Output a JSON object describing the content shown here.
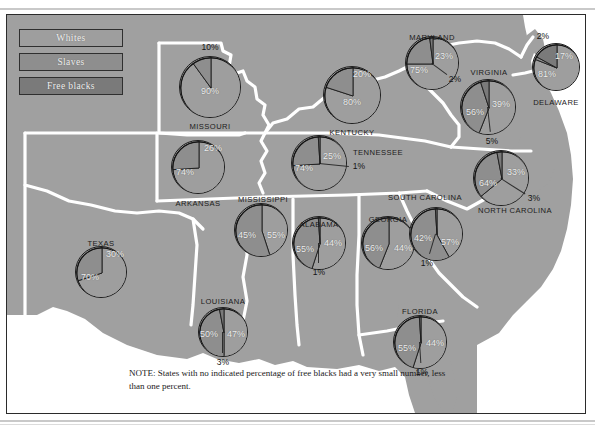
{
  "figure": {
    "title_fragment": "",
    "note": "NOTE: States with no indicated percentage of free blacks had a very small number, less than one percent."
  },
  "legend": {
    "items": [
      {
        "label": "Whites",
        "color": "#9e9e9e"
      },
      {
        "label": "Slaves",
        "color": "#8e8e8e"
      },
      {
        "label": "Free blacks",
        "color": "#7a7a7a"
      }
    ]
  },
  "chart_data": {
    "type": "pie",
    "legend": [
      "Whites",
      "Slaves",
      "Free blacks"
    ],
    "legend_position": "top-left",
    "units": "percent",
    "note": "NOTE: States with no indicated percentage of free blacks had a very small number, less than one percent.",
    "series": [
      {
        "name": "Whites",
        "color": "#9e9e9e"
      },
      {
        "name": "Slaves",
        "color": "#8e8e8e"
      },
      {
        "name": "Free blacks",
        "color": "#7a7a7a"
      }
    ],
    "states": [
      {
        "id": "missouri",
        "name": "MISSOURI",
        "whites": 90,
        "slaves": 10,
        "free_blacks": null,
        "labels": {
          "whites": "90%",
          "slaves": "10%",
          "free_blacks": ""
        }
      },
      {
        "id": "arkansas",
        "name": "ARKANSAS",
        "whites": 74,
        "slaves": 26,
        "free_blacks": null,
        "labels": {
          "whites": "74%",
          "slaves": "26%",
          "free_blacks": ""
        }
      },
      {
        "id": "texas",
        "name": "TEXAS",
        "whites": 70,
        "slaves": 30,
        "free_blacks": null,
        "labels": {
          "whites": "70%",
          "slaves": "30%",
          "free_blacks": ""
        }
      },
      {
        "id": "louisiana",
        "name": "LOUISIANA",
        "whites": 50,
        "slaves": 47,
        "free_blacks": 3,
        "labels": {
          "whites": "50%",
          "slaves": "47%",
          "free_blacks": "3%"
        }
      },
      {
        "id": "mississippi",
        "name": "MISSISSIPPI",
        "whites": 45,
        "slaves": 55,
        "free_blacks": null,
        "labels": {
          "whites": "45%",
          "slaves": "55%",
          "free_blacks": ""
        }
      },
      {
        "id": "kentucky",
        "name": "KENTUCKY",
        "whites": 80,
        "slaves": 20,
        "free_blacks": null,
        "labels": {
          "whites": "80%",
          "slaves": "20%",
          "free_blacks": ""
        }
      },
      {
        "id": "tennessee",
        "name": "TENNESSEE",
        "whites": 74,
        "slaves": 25,
        "free_blacks": 1,
        "labels": {
          "whites": "74%",
          "slaves": "25%",
          "free_blacks": "1%"
        }
      },
      {
        "id": "alabama",
        "name": "ALABAMA",
        "whites": 55,
        "slaves": 44,
        "free_blacks": 1,
        "labels": {
          "whites": "55%",
          "slaves": "44%",
          "free_blacks": "1%"
        }
      },
      {
        "id": "georgia",
        "name": "GEORGIA",
        "whites": 56,
        "slaves": 44,
        "free_blacks": null,
        "labels": {
          "whites": "56%",
          "slaves": "44%",
          "free_blacks": ""
        }
      },
      {
        "id": "florida",
        "name": "FLORIDA",
        "whites": 55,
        "slaves": 44,
        "free_blacks": 1,
        "labels": {
          "whites": "55%",
          "slaves": "44%",
          "free_blacks": "1%"
        }
      },
      {
        "id": "south-carolina",
        "name": "SOUTH CAROLINA",
        "whites": 42,
        "slaves": 57,
        "free_blacks": 1,
        "labels": {
          "whites": "42%",
          "slaves": "57%",
          "free_blacks": "1%"
        }
      },
      {
        "id": "north-carolina",
        "name": "NORTH CAROLINA",
        "whites": 64,
        "slaves": 33,
        "free_blacks": 3,
        "labels": {
          "whites": "64%",
          "slaves": "33%",
          "free_blacks": "3%"
        }
      },
      {
        "id": "virginia",
        "name": "VIRGINIA",
        "whites": 56,
        "slaves": 39,
        "free_blacks": 5,
        "labels": {
          "whites": "56%",
          "slaves": "39%",
          "free_blacks": "5%"
        }
      },
      {
        "id": "maryland",
        "name": "MARYLAND",
        "whites": 75,
        "slaves": 23,
        "free_blacks": 2,
        "labels": {
          "whites": "75%",
          "slaves": "23%",
          "free_blacks": "2%"
        }
      },
      {
        "id": "delaware",
        "name": "DELAWARE",
        "whites": 81,
        "slaves": 2,
        "free_blacks": 17,
        "labels": {
          "whites": "81%",
          "slaves": "2%",
          "free_blacks": "17%"
        }
      }
    ]
  },
  "layout": {
    "pies": {
      "missouri": {
        "cx": 203,
        "cy": 72,
        "r": 31,
        "name_x": 203,
        "name_y": 112,
        "w_x": 203,
        "w_y": 77,
        "s_x": 203,
        "s_y": 33,
        "f_x": 0,
        "f_y": 0
      },
      "arkansas": {
        "cx": 191,
        "cy": 152,
        "r": 27,
        "name_x": 191,
        "name_y": 189,
        "w_x": 178,
        "w_y": 158,
        "s_x": 206,
        "s_y": 134,
        "f_x": 0,
        "f_y": 0
      },
      "texas": {
        "cx": 94,
        "cy": 257,
        "r": 26,
        "name_x": 94,
        "name_y": 229,
        "w_x": 83,
        "w_y": 263,
        "s_x": 108,
        "s_y": 240,
        "f_x": 0,
        "f_y": 0
      },
      "louisiana": {
        "cx": 216,
        "cy": 317,
        "r": 25,
        "name_x": 216,
        "name_y": 287,
        "w_x": 202,
        "w_y": 320,
        "s_x": 229,
        "s_y": 320,
        "f_x": 216,
        "f_y": 348
      },
      "mississippi": {
        "cx": 254,
        "cy": 215,
        "r": 27,
        "name_x": 256,
        "name_y": 185,
        "w_x": 240,
        "w_y": 221,
        "s_x": 269,
        "s_y": 221,
        "f_x": 0,
        "f_y": 0
      },
      "kentucky": {
        "cx": 345,
        "cy": 80,
        "r": 29,
        "name_x": 345,
        "name_y": 118,
        "w_x": 345,
        "w_y": 88,
        "s_x": 355,
        "s_y": 60,
        "f_x": 0,
        "f_y": 0
      },
      "tennessee": {
        "cx": 312,
        "cy": 148,
        "r": 28,
        "name_x": 371,
        "name_y": 138,
        "w_x": 297,
        "w_y": 154,
        "s_x": 325,
        "s_y": 142,
        "f_x": 352,
        "f_y": 152
      },
      "alabama": {
        "cx": 312,
        "cy": 228,
        "r": 27,
        "name_x": 312,
        "name_y": 210,
        "w_x": 298,
        "w_y": 235,
        "s_x": 326,
        "s_y": 229,
        "f_x": 312,
        "f_y": 258
      },
      "georgia": {
        "cx": 381,
        "cy": 228,
        "r": 27,
        "name_x": 381,
        "name_y": 205,
        "w_x": 367,
        "w_y": 234,
        "s_x": 396,
        "s_y": 234,
        "f_x": 0,
        "f_y": 0
      },
      "florida": {
        "cx": 413,
        "cy": 327,
        "r": 27,
        "name_x": 413,
        "name_y": 297,
        "w_x": 400,
        "w_y": 334,
        "s_x": 428,
        "s_y": 329,
        "f_x": 415,
        "f_y": 358
      },
      "south-carolina": {
        "cx": 429,
        "cy": 219,
        "r": 27,
        "name_x": 418,
        "name_y": 183,
        "w_x": 416,
        "w_y": 224,
        "s_x": 443,
        "s_y": 228,
        "f_x": 420,
        "f_y": 249
      },
      "north-carolina": {
        "cx": 494,
        "cy": 163,
        "r": 28,
        "name_x": 508,
        "name_y": 196,
        "w_x": 481,
        "w_y": 169,
        "s_x": 509,
        "s_y": 158,
        "f_x": 527,
        "f_y": 184
      },
      "virginia": {
        "cx": 481,
        "cy": 92,
        "r": 28,
        "name_x": 482,
        "name_y": 58,
        "w_x": 468,
        "w_y": 98,
        "s_x": 494,
        "s_y": 90,
        "f_x": 485,
        "f_y": 127
      },
      "maryland": {
        "cx": 425,
        "cy": 48,
        "r": 27,
        "name_x": 425,
        "name_y": 23,
        "w_x": 412,
        "w_y": 56,
        "s_x": 437,
        "s_y": 42,
        "f_x": 448,
        "f_y": 65
      },
      "delaware": {
        "cx": 549,
        "cy": 52,
        "r": 24,
        "name_x": 549,
        "name_y": 88,
        "w_x": 540,
        "w_y": 60,
        "s_x": 536,
        "s_y": 22,
        "f_x": 557,
        "f_y": 42
      }
    }
  }
}
